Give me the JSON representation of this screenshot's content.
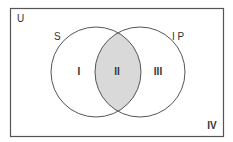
{
  "diagram": {
    "type": "venn",
    "universe_label": "U",
    "sets": [
      {
        "label": "S",
        "region_label": "I"
      },
      {
        "label": "I P",
        "region_label": "III"
      }
    ],
    "intersection_label": "II",
    "outside_label": "IV",
    "colors": {
      "stroke": "#555555",
      "intersection_fill": "#d9d9d9",
      "background": "#ffffff"
    }
  }
}
